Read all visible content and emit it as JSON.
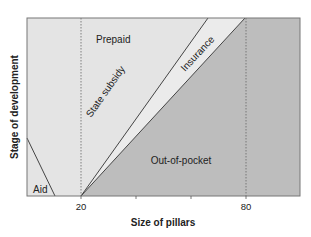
{
  "figure": {
    "type": "region-diagram",
    "xlabel": "Size of pillars",
    "ylabel": "Stage of development",
    "x_ticks": [
      {
        "label": "20",
        "value": 20
      },
      {
        "label": "",
        "value": 40
      },
      {
        "label": "",
        "value": 60
      },
      {
        "label": "80",
        "value": 80
      }
    ],
    "reference_lines": [
      {
        "axis": "x",
        "value": 20,
        "style": "dotted"
      },
      {
        "axis": "x",
        "value": 80,
        "style": "dotted"
      }
    ],
    "regions": {
      "aid": "Aid",
      "prepaid": "Prepaid",
      "state_subsidy": "State subsidy",
      "insurance": "Insurance",
      "out_of_pocket": "Out-of-pocket"
    },
    "colors": {
      "light_fill": "#e4e4e4",
      "dark_fill": "#bdbdbd",
      "line": "#444444",
      "frame": "#777777",
      "text": "#222222"
    }
  }
}
